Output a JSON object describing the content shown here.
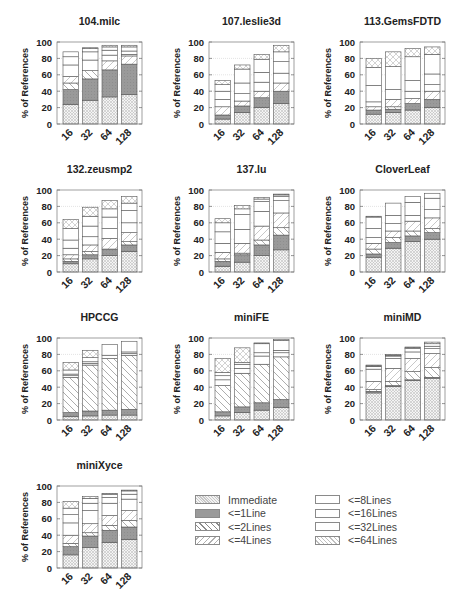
{
  "figure": {
    "ylabel": "% of References",
    "yticks": [
      0,
      20,
      40,
      60,
      80,
      100
    ],
    "categories": [
      "16",
      "32",
      "64",
      "128"
    ]
  },
  "legend": {
    "items": [
      {
        "key": "immediate",
        "label": "Immediate"
      },
      {
        "key": "l1",
        "label": "<=1Line"
      },
      {
        "key": "l2",
        "label": "<=2Lines"
      },
      {
        "key": "l4",
        "label": "<=4Lines"
      },
      {
        "key": "l8",
        "label": "<=8Lines"
      },
      {
        "key": "l16",
        "label": "<=16Lines"
      },
      {
        "key": "l32",
        "label": "<=32Lines"
      },
      {
        "key": "l64",
        "label": "<=64Lines"
      }
    ]
  },
  "chart_data": [
    {
      "type": "bar",
      "stacked": true,
      "title": "104.milc",
      "xlabel": "",
      "ylabel": "% of References",
      "ylim": [
        0,
        100
      ],
      "categories": [
        "16",
        "32",
        "64",
        "128"
      ],
      "series": [
        {
          "name": "Immediate",
          "values": [
            24,
            29,
            33,
            36
          ]
        },
        {
          "name": "<=1Line",
          "values": [
            18,
            26,
            33,
            37
          ]
        },
        {
          "name": "<=2Lines",
          "values": [
            8,
            10,
            0,
            0
          ]
        },
        {
          "name": "<=4Lines",
          "values": [
            8,
            0,
            11,
            10
          ]
        },
        {
          "name": "<=8Lines",
          "values": [
            14,
            13,
            7,
            2
          ]
        },
        {
          "name": "<=16Lines",
          "values": [
            10,
            10,
            6,
            4
          ]
        },
        {
          "name": "<=32Lines",
          "values": [
            6,
            4,
            4,
            5
          ]
        },
        {
          "name": "<=64Lines",
          "values": [
            0,
            1,
            2,
            2
          ]
        }
      ]
    },
    {
      "type": "bar",
      "stacked": true,
      "title": "107.leslie3d",
      "xlabel": "",
      "ylabel": "% of References",
      "ylim": [
        0,
        100
      ],
      "categories": [
        "16",
        "32",
        "64",
        "128"
      ],
      "series": [
        {
          "name": "Immediate",
          "values": [
            6,
            14,
            20,
            25
          ]
        },
        {
          "name": "<=1Line",
          "values": [
            5,
            8,
            12,
            15
          ]
        },
        {
          "name": "<=2Lines",
          "values": [
            0,
            0,
            0,
            0
          ]
        },
        {
          "name": "<=4Lines",
          "values": [
            10,
            6,
            8,
            10
          ]
        },
        {
          "name": "<=8Lines",
          "values": [
            9,
            9,
            11,
            12
          ]
        },
        {
          "name": "<=16Lines",
          "values": [
            10,
            13,
            12,
            14
          ]
        },
        {
          "name": "<=32Lines",
          "values": [
            8,
            17,
            16,
            12
          ]
        },
        {
          "name": "<=64Lines",
          "values": [
            5,
            5,
            6,
            8
          ]
        }
      ]
    },
    {
      "type": "bar",
      "stacked": true,
      "title": "113.GemsFDTD",
      "xlabel": "",
      "ylabel": "% of References",
      "ylim": [
        0,
        100
      ],
      "categories": [
        "16",
        "32",
        "64",
        "128"
      ],
      "series": [
        {
          "name": "Immediate",
          "values": [
            12,
            14,
            17,
            20
          ]
        },
        {
          "name": "<=1Line",
          "values": [
            5,
            4,
            8,
            10
          ]
        },
        {
          "name": "<=2Lines",
          "values": [
            0,
            3,
            0,
            0
          ]
        },
        {
          "name": "<=4Lines",
          "values": [
            4,
            9,
            6,
            10
          ]
        },
        {
          "name": "<=8Lines",
          "values": [
            6,
            12,
            9,
            8
          ]
        },
        {
          "name": "<=16Lines",
          "values": [
            20,
            28,
            13,
            13
          ]
        },
        {
          "name": "<=32Lines",
          "values": [
            22,
            0,
            29,
            24
          ]
        },
        {
          "name": "<=64Lines",
          "values": [
            11,
            18,
            10,
            9
          ]
        }
      ]
    },
    {
      "type": "bar",
      "stacked": true,
      "title": "132.zeusmp2",
      "xlabel": "",
      "ylabel": "% of References",
      "ylim": [
        0,
        100
      ],
      "categories": [
        "16",
        "32",
        "64",
        "128"
      ],
      "series": [
        {
          "name": "Immediate",
          "values": [
            10,
            16,
            20,
            25
          ]
        },
        {
          "name": "<=1Line",
          "values": [
            3,
            5,
            8,
            8
          ]
        },
        {
          "name": "<=2Lines",
          "values": [
            3,
            4,
            0,
            4
          ]
        },
        {
          "name": "<=4Lines",
          "values": [
            5,
            8,
            13,
            11
          ]
        },
        {
          "name": "<=8Lines",
          "values": [
            8,
            10,
            12,
            12
          ]
        },
        {
          "name": "<=16Lines",
          "values": [
            10,
            13,
            14,
            15
          ]
        },
        {
          "name": "<=32Lines",
          "values": [
            14,
            12,
            10,
            9
          ]
        },
        {
          "name": "<=64Lines",
          "values": [
            11,
            11,
            10,
            8
          ]
        }
      ]
    },
    {
      "type": "bar",
      "stacked": true,
      "title": "137.lu",
      "xlabel": "",
      "ylabel": "% of References",
      "ylim": [
        0,
        100
      ],
      "categories": [
        "16",
        "32",
        "64",
        "128"
      ],
      "series": [
        {
          "name": "Immediate",
          "values": [
            7,
            12,
            20,
            27
          ]
        },
        {
          "name": "<=1Line",
          "values": [
            6,
            9,
            13,
            18
          ]
        },
        {
          "name": "<=2Lines",
          "values": [
            3,
            2,
            6,
            9
          ]
        },
        {
          "name": "<=4Lines",
          "values": [
            8,
            12,
            17,
            18
          ]
        },
        {
          "name": "<=8Lines",
          "values": [
            11,
            17,
            18,
            15
          ]
        },
        {
          "name": "<=16Lines",
          "values": [
            14,
            18,
            12,
            5
          ]
        },
        {
          "name": "<=32Lines",
          "values": [
            11,
            7,
            3,
            2
          ]
        },
        {
          "name": "<=64Lines",
          "values": [
            5,
            4,
            2,
            1
          ]
        }
      ]
    },
    {
      "type": "bar",
      "stacked": true,
      "title": "CloverLeaf",
      "xlabel": "",
      "ylabel": "% of References",
      "ylim": [
        0,
        100
      ],
      "categories": [
        "16",
        "32",
        "64",
        "128"
      ],
      "series": [
        {
          "name": "Immediate",
          "values": [
            18,
            29,
            37,
            40
          ]
        },
        {
          "name": "<=1Line",
          "values": [
            4,
            7,
            7,
            8
          ]
        },
        {
          "name": "<=2Lines",
          "values": [
            6,
            6,
            6,
            5
          ]
        },
        {
          "name": "<=4Lines",
          "values": [
            7,
            8,
            12,
            13
          ]
        },
        {
          "name": "<=8Lines",
          "values": [
            7,
            9,
            7,
            10
          ]
        },
        {
          "name": "<=16Lines",
          "values": [
            11,
            10,
            16,
            14
          ]
        },
        {
          "name": "<=32Lines",
          "values": [
            14,
            15,
            7,
            6
          ]
        },
        {
          "name": "<=64Lines",
          "values": [
            1,
            0,
            0,
            0
          ]
        }
      ]
    },
    {
      "type": "bar",
      "stacked": true,
      "title": "HPCCG",
      "xlabel": "",
      "ylabel": "% of References",
      "ylim": [
        0,
        100
      ],
      "categories": [
        "16",
        "32",
        "64",
        "128"
      ],
      "series": [
        {
          "name": "Immediate",
          "values": [
            4,
            5,
            6,
            6
          ]
        },
        {
          "name": "<=1Line",
          "values": [
            5,
            6,
            6,
            7
          ]
        },
        {
          "name": "<=2Lines",
          "values": [
            43,
            56,
            63,
            66
          ]
        },
        {
          "name": "<=4Lines",
          "values": [
            0,
            0,
            0,
            0
          ]
        },
        {
          "name": "<=8Lines",
          "values": [
            2,
            2,
            4,
            2
          ]
        },
        {
          "name": "<=16Lines",
          "values": [
            2,
            2,
            0,
            2
          ]
        },
        {
          "name": "<=32Lines",
          "values": [
            5,
            5,
            13,
            13
          ]
        },
        {
          "name": "<=64Lines",
          "values": [
            9,
            9,
            0,
            0
          ]
        }
      ]
    },
    {
      "type": "bar",
      "stacked": true,
      "title": "miniFE",
      "xlabel": "",
      "ylabel": "% of References",
      "ylim": [
        0,
        100
      ],
      "categories": [
        "16",
        "32",
        "64",
        "128"
      ],
      "series": [
        {
          "name": "Immediate",
          "values": [
            5,
            9,
            12,
            15
          ]
        },
        {
          "name": "<=1Line",
          "values": [
            5,
            7,
            9,
            10
          ]
        },
        {
          "name": "<=2Lines",
          "values": [
            32,
            41,
            47,
            52
          ]
        },
        {
          "name": "<=4Lines",
          "values": [
            0,
            0,
            0,
            0
          ]
        },
        {
          "name": "<=8Lines",
          "values": [
            7,
            6,
            10,
            5
          ]
        },
        {
          "name": "<=16Lines",
          "values": [
            5,
            5,
            4,
            3
          ]
        },
        {
          "name": "<=32Lines",
          "values": [
            4,
            2,
            11,
            12
          ]
        },
        {
          "name": "<=64Lines",
          "values": [
            17,
            18,
            1,
            1
          ]
        }
      ]
    },
    {
      "type": "bar",
      "stacked": true,
      "title": "miniMD",
      "xlabel": "",
      "ylabel": "% of References",
      "ylim": [
        0,
        100
      ],
      "categories": [
        "16",
        "32",
        "64",
        "128"
      ],
      "series": [
        {
          "name": "Immediate",
          "values": [
            33,
            41,
            48,
            51
          ]
        },
        {
          "name": "<=1Line",
          "values": [
            2,
            1,
            1,
            1
          ]
        },
        {
          "name": "<=2Lines",
          "values": [
            2,
            5,
            10,
            12
          ]
        },
        {
          "name": "<=4Lines",
          "values": [
            10,
            16,
            16,
            17
          ]
        },
        {
          "name": "<=8Lines",
          "values": [
            15,
            12,
            8,
            6
          ]
        },
        {
          "name": "<=16Lines",
          "values": [
            3,
            3,
            4,
            3
          ]
        },
        {
          "name": "<=32Lines",
          "values": [
            1,
            1,
            1,
            3
          ]
        },
        {
          "name": "<=64Lines",
          "values": [
            1,
            1,
            1,
            2
          ]
        }
      ]
    },
    {
      "type": "bar",
      "stacked": true,
      "title": "miniXyce",
      "xlabel": "",
      "ylabel": "% of References",
      "ylim": [
        0,
        100
      ],
      "categories": [
        "16",
        "32",
        "64",
        "128"
      ],
      "series": [
        {
          "name": "Immediate",
          "values": [
            16,
            25,
            31,
            35
          ]
        },
        {
          "name": "<=1Line",
          "values": [
            10,
            14,
            15,
            15
          ]
        },
        {
          "name": "<=2Lines",
          "values": [
            4,
            4,
            6,
            8
          ]
        },
        {
          "name": "<=4Lines",
          "values": [
            10,
            11,
            12,
            12
          ]
        },
        {
          "name": "<=8Lines",
          "values": [
            15,
            16,
            15,
            14
          ]
        },
        {
          "name": "<=16Lines",
          "values": [
            10,
            9,
            7,
            6
          ]
        },
        {
          "name": "<=32Lines",
          "values": [
            8,
            6,
            4,
            4
          ]
        },
        {
          "name": "<=64Lines",
          "values": [
            8,
            2,
            1,
            1
          ]
        }
      ]
    }
  ]
}
